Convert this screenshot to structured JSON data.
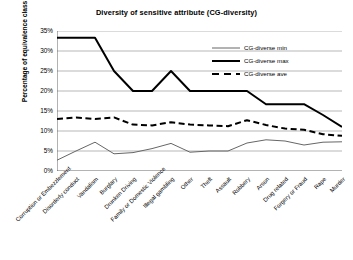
{
  "chart_data": {
    "type": "line",
    "title": "Diversity of sensitive attribute (CG-diversity)",
    "xlabel": "",
    "ylabel": "Percentage of equivalence class",
    "ylim": [
      0,
      35
    ],
    "ytick_labels": [
      "0%",
      "5%",
      "10%",
      "15%",
      "20%",
      "25%",
      "30%",
      "35%"
    ],
    "ytick_values": [
      0,
      5,
      10,
      15,
      20,
      25,
      30,
      35
    ],
    "grid": true,
    "legend_position": "top-right",
    "categories": [
      "Corruption or Embezzlement",
      "Disorderly conduct",
      "Vandalism",
      "Burglary",
      "Drunken Driving",
      "Family or Domestic Violence",
      "Illegal gambling",
      "Other",
      "Theft",
      "Assault",
      "Robbery",
      "Arson",
      "Drug related",
      "Forgery or Fraud",
      "Rape",
      "Murder"
    ],
    "series": [
      {
        "name": "CG-diverse min",
        "style": "solid-thin",
        "color": "#666666",
        "values": [
          2.7,
          5.0,
          7.2,
          4.3,
          4.6,
          5.6,
          6.9,
          4.7,
          5.0,
          5.0,
          7.0,
          7.8,
          7.5,
          6.5,
          7.2,
          7.3
        ]
      },
      {
        "name": "CG-diverse max",
        "style": "solid-thick",
        "color": "#000000",
        "values": [
          33.3,
          33.3,
          33.3,
          25.0,
          20.0,
          20.0,
          25.0,
          20.0,
          20.0,
          20.0,
          20.0,
          16.7,
          16.7,
          16.7,
          14.0,
          11.0
        ]
      },
      {
        "name": "CG-diverse ave",
        "style": "dashed-thick",
        "color": "#000000",
        "values": [
          13.0,
          13.4,
          13.0,
          13.4,
          11.6,
          11.4,
          12.2,
          11.6,
          11.4,
          11.2,
          12.7,
          11.5,
          10.6,
          10.3,
          9.2,
          8.8
        ]
      }
    ]
  },
  "legend": {
    "items": [
      {
        "label": "CG-diverse min"
      },
      {
        "label": "CG-diverse max"
      },
      {
        "label": "CG-diverse ave"
      }
    ]
  }
}
